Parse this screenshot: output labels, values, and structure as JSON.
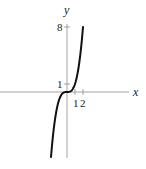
{
  "chart_data": {
    "type": "line",
    "title": "",
    "function": "y = x^3",
    "xlabel": "x",
    "ylabel": "y",
    "x_ticks": [
      1,
      2
    ],
    "x_tick_labels": [
      "1",
      "2"
    ],
    "y_ticks": [
      1,
      8
    ],
    "y_tick_labels": [
      "1",
      "8"
    ],
    "xlim": [
      -8.3,
      7.6
    ],
    "ylim": [
      -8.1,
      8.6
    ],
    "grid": false,
    "legend": null,
    "series": [
      {
        "name": "y = x^3",
        "x": [
          -2,
          -1.5,
          -1,
          -0.5,
          0,
          0.5,
          1,
          1.5,
          2
        ],
        "y": [
          -8,
          -3.375,
          -1,
          -0.125,
          0,
          0.125,
          1,
          3.375,
          8
        ]
      }
    ],
    "colors": {
      "curve": "#111111",
      "axis": "#888888"
    }
  }
}
